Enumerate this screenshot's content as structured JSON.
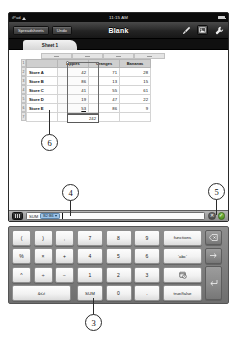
{
  "status_bar": {
    "carrier": "iPad",
    "wifi_icon": "wifi-icon",
    "time": "11:15 AM",
    "battery_label": "88%",
    "battery_icon": "battery-icon"
  },
  "toolbar": {
    "spreadsheets_label": "Spreadsheets",
    "undo_label": "Undo",
    "document_title": "Blank",
    "brush_icon": "paintbrush-icon",
    "insert_icon": "insert-media-icon",
    "tools_icon": "wrench-icon"
  },
  "sheet_tab": {
    "label": "Sheet 1"
  },
  "table": {
    "column_headers": [
      "A",
      "B",
      "C",
      "D"
    ],
    "row_numbers": [
      "1",
      "2",
      "3",
      "4",
      "5",
      "6",
      "7"
    ],
    "header_row": [
      "",
      "Apples",
      "Oranges",
      "Bananas"
    ],
    "rows": [
      {
        "label": "Store A",
        "values": [
          "42",
          "71",
          "28"
        ]
      },
      {
        "label": "Store B",
        "values": [
          "86",
          "13",
          "15"
        ]
      },
      {
        "label": "Store C",
        "values": [
          "41",
          "55",
          "61"
        ]
      },
      {
        "label": "Store D",
        "values": [
          "19",
          "47",
          "22"
        ]
      },
      {
        "label": "Store E",
        "values": [
          "53",
          "86",
          "9"
        ]
      }
    ],
    "result_cell_value": "242"
  },
  "formula_bar": {
    "grip_icon": "keyboard-grip-icon",
    "function_name": "SUM",
    "range_token": "B2:B6",
    "token_menu_icon": "chevron-down-icon",
    "cancel_label": "✕",
    "accept_label": "✓"
  },
  "keyboard": {
    "operators": [
      [
        "(",
        ")",
        ","
      ],
      [
        "%",
        "×",
        "+"
      ],
      [
        "^",
        "÷",
        "−"
      ]
    ],
    "compare_key": "&≤≠",
    "numbers": [
      [
        "7",
        "8",
        "9"
      ],
      [
        "4",
        "5",
        "6"
      ],
      [
        "1",
        "2",
        "3"
      ]
    ],
    "sum_key": "SUM",
    "zero_key": "0",
    "decimal_key": ".",
    "functions_key": "functions",
    "abc_key": "'abc'",
    "date_key_icon": "calendar-clock-icon",
    "truefalse_key": "true/false",
    "delete_key_icon": "delete-backward-icon",
    "next_key_icon": "arrow-right-icon",
    "return_key_icon": "return-key-icon"
  },
  "callouts": {
    "three": "3",
    "four": "4",
    "five": "5",
    "six": "6"
  }
}
